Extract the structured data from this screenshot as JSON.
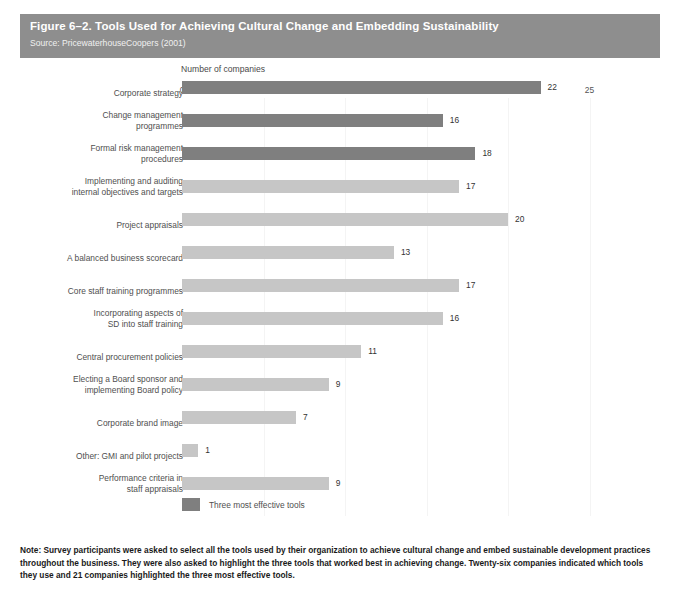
{
  "figure": {
    "title": "Figure 6–2. Tools Used for Achieving Cultural Change and Embedding Sustainability",
    "source": "Source: PricewaterhouseCoopers (2001)",
    "note": "Note: Survey participants were asked to select all the tools used by their organization to achieve cultural change and embed sustainable development practices throughout the business. They were also asked to highlight the three tools that worked best in achieving change. Twenty-six companies indicated which tools they use and 21 companies highlighted the three most effective tools."
  },
  "legend": {
    "label": "Three most effective tools",
    "swatch_color": "#7f7f7f"
  },
  "colors": {
    "header_band": "#8e8e8e",
    "bar_default": "#c6c6c6",
    "bar_effective": "#7f7f7f",
    "background": "#ffffff"
  },
  "chart_data": {
    "type": "bar",
    "orientation": "horizontal",
    "title": "Figure 6–2. Tools Used for Achieving Cultural Change and Embedding Sustainability",
    "xlabel": "Number of companies",
    "ylabel": "",
    "xlim": [
      0,
      25
    ],
    "xticks": [
      0,
      5,
      10,
      15,
      20,
      25
    ],
    "grid": false,
    "legend_position": "bottom-left",
    "categories": [
      "Corporate strategy",
      "Change management programmes",
      "Formal risk management procedures",
      "Implementing and auditing internal objectives and targets",
      "Project appraisals",
      "A balanced business scorecard",
      "Core staff training programmes",
      "Incorporating aspects of SD into staff training",
      "Central procurement policies",
      "Electing a Board sponsor and implementing Board policy",
      "Corporate brand image",
      "Other: GMI and pilot projects",
      "Performance criteria in staff appraisals"
    ],
    "category_lines": [
      [
        "Corporate strategy"
      ],
      [
        "Change management",
        "programmes"
      ],
      [
        "Formal risk management",
        "procedures"
      ],
      [
        "Implementing and auditing",
        "internal objectives and targets"
      ],
      [
        "Project appraisals"
      ],
      [
        "A balanced business scorecard"
      ],
      [
        "Core staff training programmes"
      ],
      [
        "Incorporating aspects of",
        "SD into staff training"
      ],
      [
        "Central procurement policies"
      ],
      [
        "Electing a Board sponsor and",
        "implementing Board policy"
      ],
      [
        "Corporate brand image"
      ],
      [
        "Other: GMI and pilot projects"
      ],
      [
        "Performance criteria in",
        "staff appraisals"
      ]
    ],
    "values": [
      22,
      16,
      18,
      17,
      20,
      13,
      17,
      16,
      11,
      9,
      7,
      1,
      9
    ],
    "effective": [
      true,
      true,
      true,
      false,
      false,
      false,
      false,
      false,
      false,
      false,
      false,
      false,
      false
    ],
    "series": [
      {
        "name": "Number of companies",
        "values": [
          22,
          16,
          18,
          17,
          20,
          13,
          17,
          16,
          11,
          9,
          7,
          1,
          9
        ]
      }
    ]
  }
}
